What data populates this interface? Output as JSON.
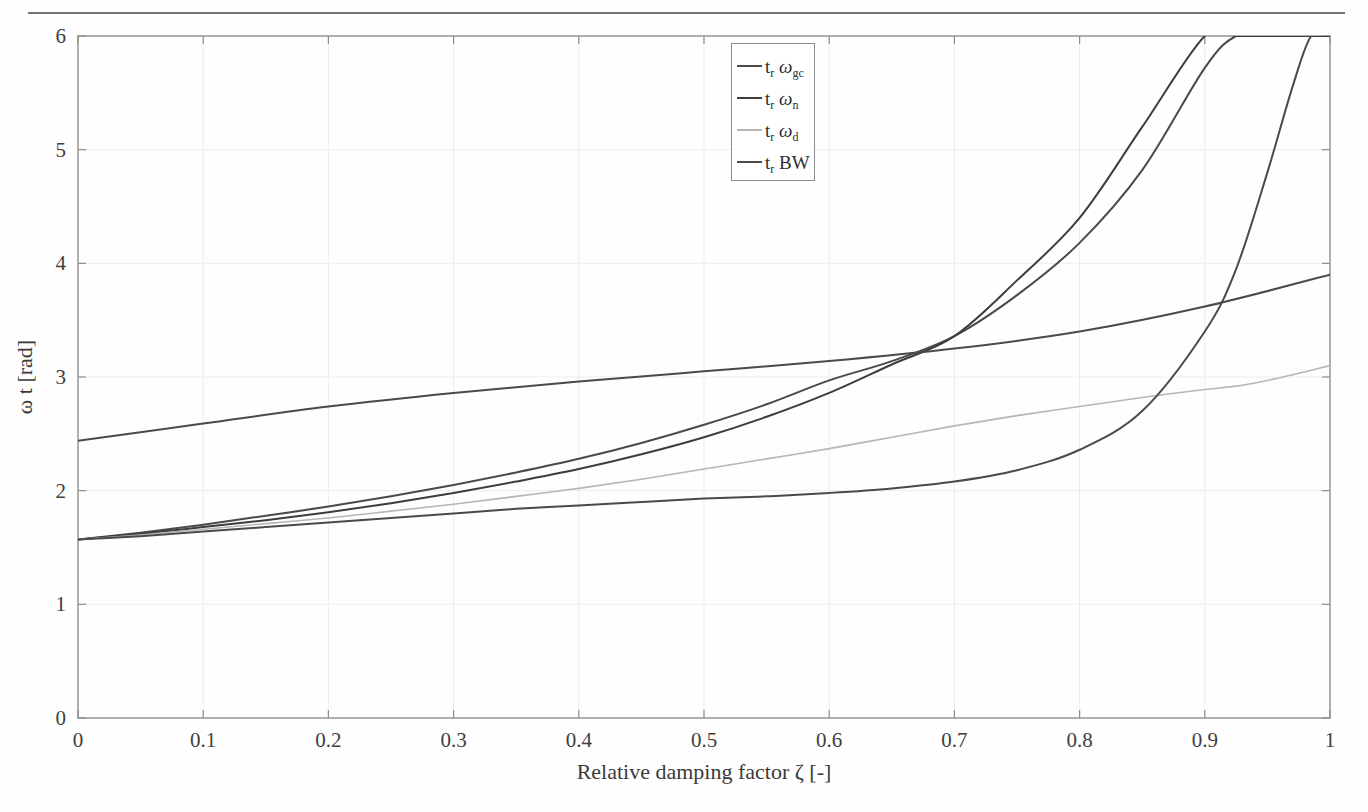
{
  "figure": {
    "background_color": "#ffffff",
    "axis_color": "#8d8d8d",
    "grid_color": "#ededed"
  },
  "legend": {
    "position": "top-center",
    "entries": [
      {
        "label": "t_r ω_gc",
        "prefix": "t",
        "prefix_sub": "r",
        "symbol": "ω",
        "symbol_sub": "gc",
        "color": "#4a4a4a"
      },
      {
        "label": "t_r ω_n",
        "prefix": "t",
        "prefix_sub": "r",
        "symbol": "ω",
        "symbol_sub": "n",
        "color": "#3d3d3d"
      },
      {
        "label": "t_r ω_d",
        "prefix": "t",
        "prefix_sub": "r",
        "symbol": "ω",
        "symbol_sub": "d",
        "color": "#b6b6b6"
      },
      {
        "label": "t_r BW",
        "prefix": "t",
        "prefix_sub": "r",
        "symbol": "BW",
        "symbol_sub": "",
        "color": "#4a4a4a"
      }
    ]
  },
  "chart_data": {
    "type": "line",
    "title": "",
    "xlabel": "Relative damping factor ζ [-]",
    "ylabel": "ω t [rad]",
    "xlim": [
      0,
      1
    ],
    "ylim": [
      0,
      6
    ],
    "xticks": [
      0,
      0.1,
      0.2,
      0.3,
      0.4,
      0.5,
      0.6,
      0.7,
      0.8,
      0.9,
      1
    ],
    "xticklabels": [
      "0",
      "0.1",
      "0.2",
      "0.3",
      "0.4",
      "0.5",
      "0.6",
      "0.7",
      "0.8",
      "0.9",
      "1"
    ],
    "yticks": [
      0,
      1,
      2,
      3,
      4,
      5,
      6
    ],
    "yticklabels": [
      "0",
      "1",
      "2",
      "3",
      "4",
      "5",
      "6"
    ],
    "grid": true,
    "legend_position": "top-center",
    "x": [
      0,
      0.05,
      0.1,
      0.15,
      0.2,
      0.25,
      0.3,
      0.35,
      0.4,
      0.45,
      0.5,
      0.55,
      0.6,
      0.65,
      0.7,
      0.75,
      0.8,
      0.85,
      0.9,
      0.925,
      0.95,
      0.97,
      0.985,
      1
    ],
    "series": [
      {
        "name": "t_r ω_gc",
        "color": "#4a4a4a",
        "width": 2.0,
        "values": [
          1.57,
          1.63,
          1.7,
          1.78,
          1.86,
          1.95,
          2.05,
          2.16,
          2.28,
          2.42,
          2.58,
          2.76,
          2.97,
          3.14,
          3.36,
          3.72,
          4.18,
          4.82,
          5.72,
          6.0,
          6.0,
          6.0,
          6.0,
          6.0
        ]
      },
      {
        "name": "t_r ω_n",
        "color": "#3d3d3d",
        "width": 2.0,
        "values": [
          1.57,
          1.62,
          1.68,
          1.74,
          1.81,
          1.89,
          1.98,
          2.08,
          2.19,
          2.32,
          2.47,
          2.65,
          2.86,
          3.11,
          3.36,
          3.85,
          4.4,
          5.2,
          6.0,
          6.0,
          6.0,
          6.0,
          6.0,
          6.0
        ]
      },
      {
        "name": "t_r ω_d",
        "color": "#b6b6b6",
        "width": 1.6,
        "values": [
          1.57,
          1.61,
          1.66,
          1.71,
          1.76,
          1.82,
          1.88,
          1.95,
          2.02,
          2.1,
          2.19,
          2.28,
          2.37,
          2.47,
          2.57,
          2.66,
          2.74,
          2.82,
          2.89,
          2.92,
          2.97,
          3.02,
          3.06,
          3.1
        ]
      },
      {
        "name": "t_r BW",
        "color": "#4a4a4a",
        "width": 2.0,
        "values": [
          1.57,
          1.6,
          1.64,
          1.68,
          1.72,
          1.76,
          1.8,
          1.84,
          1.87,
          1.9,
          1.93,
          1.95,
          1.98,
          2.02,
          2.08,
          2.18,
          2.36,
          2.7,
          3.4,
          3.95,
          4.8,
          5.55,
          6.0,
          6.0
        ]
      }
    ]
  },
  "secondary_curves": {
    "gc_upper": {
      "name": "t_r ω_gc upper branch",
      "color": "#4a4a4a",
      "x": [
        0,
        0.1,
        0.2,
        0.3,
        0.4,
        0.5,
        0.6,
        0.7,
        0.8,
        0.9,
        1
      ],
      "values": [
        2.44,
        2.59,
        2.74,
        2.86,
        2.96,
        3.05,
        3.14,
        3.25,
        3.4,
        3.62,
        3.9
      ]
    }
  }
}
